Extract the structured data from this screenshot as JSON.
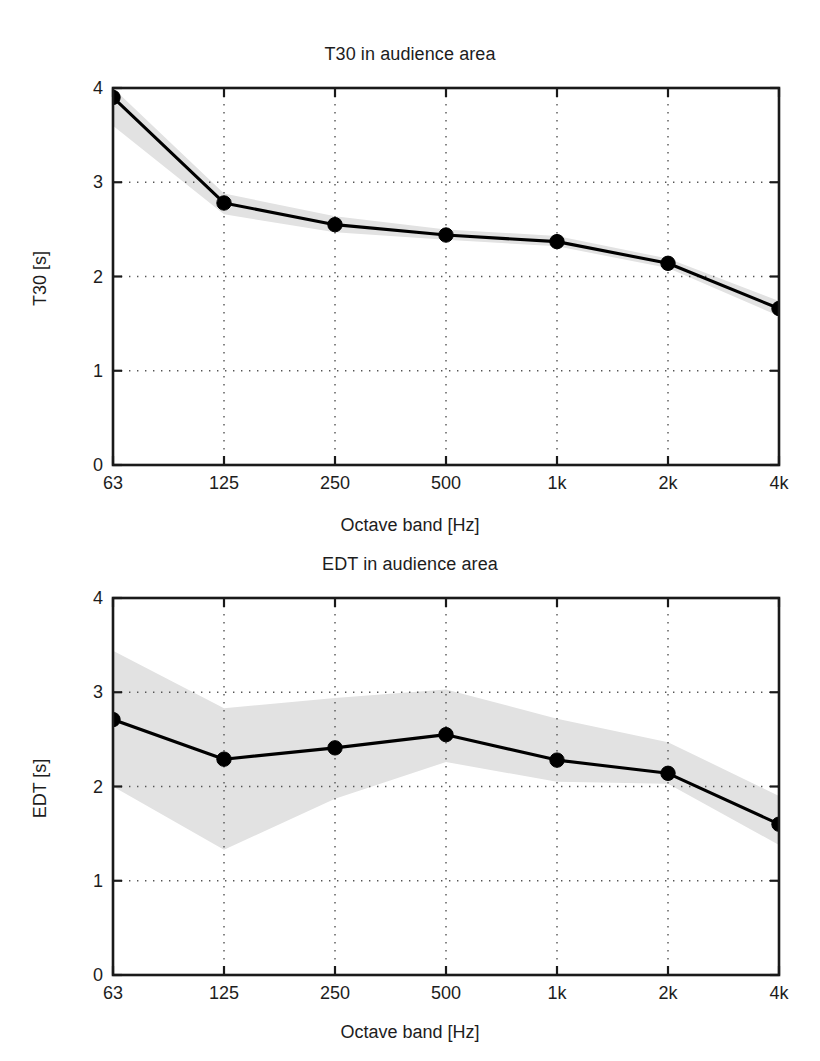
{
  "figure": {
    "background_color": "#ffffff",
    "line_color": "#000000",
    "band_color": "#e2e2e2",
    "grid_color": "#555555",
    "axis_color": "#1a1a1a"
  },
  "panels": [
    {
      "id": "t30",
      "title": "T30 in audience area",
      "ylabel": "T30 [s]",
      "xlabel": "Octave band [Hz]",
      "ytick_labels": [
        "4",
        "3",
        "2",
        "1",
        "0"
      ],
      "xtick_labels": [
        "63",
        "125",
        "250",
        "500",
        "1k",
        "2k",
        "4k"
      ]
    },
    {
      "id": "edt",
      "title": "EDT in audience area",
      "ylabel": "EDT [s]",
      "xlabel": "Octave band [Hz]",
      "ytick_labels": [
        "4",
        "3",
        "2",
        "1",
        "0"
      ],
      "xtick_labels": [
        "63",
        "125",
        "250",
        "500",
        "1k",
        "2k",
        "4k"
      ]
    }
  ],
  "chart_data": [
    {
      "type": "line",
      "id": "t30",
      "title": "T30 in audience area",
      "xlabel": "Octave band [Hz]",
      "ylabel": "T30 [s]",
      "categories": [
        "63",
        "125",
        "250",
        "500",
        "1k",
        "2k",
        "4k"
      ],
      "x_tick_labels": [
        "63",
        "125",
        "250",
        "500",
        "1k",
        "2k",
        "4k"
      ],
      "y_tick_labels": [
        "0",
        "1",
        "2",
        "3",
        "4"
      ],
      "ylim": [
        0,
        4
      ],
      "yticks": [
        0,
        1,
        2,
        3,
        4
      ],
      "grid": true,
      "legend": "none",
      "series": [
        {
          "name": "T30 mean",
          "marker": "filled-circle",
          "values": [
            3.9,
            2.78,
            2.55,
            2.44,
            2.37,
            2.14,
            1.66
          ]
        },
        {
          "name": "spread band upper",
          "style": "shaded-area",
          "values": [
            4.0,
            2.88,
            2.64,
            2.5,
            2.43,
            2.19,
            1.74
          ]
        },
        {
          "name": "spread band lower",
          "style": "shaded-area",
          "values": [
            3.6,
            2.66,
            2.47,
            2.39,
            2.32,
            2.09,
            1.58
          ]
        }
      ]
    },
    {
      "type": "line",
      "id": "edt",
      "title": "EDT in audience area",
      "xlabel": "Octave band [Hz]",
      "ylabel": "EDT [s]",
      "categories": [
        "63",
        "125",
        "250",
        "500",
        "1k",
        "2k",
        "4k"
      ],
      "x_tick_labels": [
        "63",
        "125",
        "250",
        "500",
        "1k",
        "2k",
        "4k"
      ],
      "y_tick_labels": [
        "0",
        "1",
        "2",
        "3",
        "4"
      ],
      "ylim": [
        0,
        4
      ],
      "yticks": [
        0,
        1,
        2,
        3,
        4
      ],
      "grid": true,
      "legend": "none",
      "series": [
        {
          "name": "EDT mean",
          "marker": "filled-circle",
          "values": [
            2.71,
            2.29,
            2.41,
            2.55,
            2.28,
            2.14,
            1.6
          ]
        },
        {
          "name": "spread band upper",
          "style": "shaded-area",
          "values": [
            3.44,
            2.83,
            2.94,
            3.03,
            2.72,
            2.47,
            1.9
          ]
        },
        {
          "name": "spread band lower",
          "style": "shaded-area",
          "values": [
            2.0,
            1.33,
            1.87,
            2.26,
            2.05,
            2.03,
            1.38
          ]
        }
      ]
    }
  ]
}
